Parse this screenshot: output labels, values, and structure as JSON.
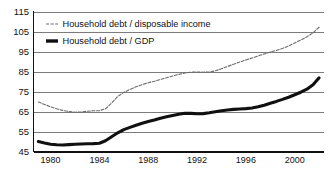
{
  "chart_data": {
    "type": "line",
    "title": "",
    "subtitle": "",
    "xlabel": "",
    "ylabel": "",
    "xlim": [
      1978.6,
      2002.4
    ],
    "ylim": [
      45,
      115
    ],
    "grid": true,
    "legend_position": "top-left",
    "yticks": [
      45,
      55,
      65,
      75,
      85,
      95,
      105,
      115
    ],
    "ytick_labels": [
      "45",
      "55",
      "65",
      "75",
      "85",
      "95",
      "105",
      "115"
    ],
    "xticks": [
      1980,
      1984,
      1988,
      1992,
      1996,
      2000
    ],
    "xtick_labels": [
      "1980",
      "1984",
      "1988",
      "1992",
      "1996",
      "2000"
    ],
    "series": [
      {
        "name": "Household debt / disposable income",
        "style": "dashed-thin",
        "color": "#6b6b6b",
        "x": [
          1979.0,
          1979.5,
          1980.0,
          1980.5,
          1981.0,
          1981.5,
          1982.0,
          1982.5,
          1983.0,
          1983.5,
          1984.0,
          1984.5,
          1985.0,
          1985.5,
          1986.0,
          1986.5,
          1987.0,
          1987.5,
          1988.0,
          1988.5,
          1989.0,
          1989.5,
          1990.0,
          1990.5,
          1991.0,
          1991.5,
          1992.0,
          1992.5,
          1993.0,
          1993.5,
          1994.0,
          1994.5,
          1995.0,
          1995.5,
          1996.0,
          1996.5,
          1997.0,
          1997.5,
          1998.0,
          1998.5,
          1999.0,
          1999.5,
          2000.0,
          2000.5,
          2001.0,
          2001.5,
          2002.0
        ],
        "y": [
          70.0,
          68.8,
          67.6,
          66.6,
          65.8,
          65.2,
          64.9,
          65.0,
          65.4,
          65.6,
          65.7,
          66.6,
          69.5,
          72.8,
          74.8,
          76.3,
          77.6,
          78.7,
          79.6,
          80.4,
          81.3,
          82.1,
          83.0,
          83.8,
          84.5,
          84.9,
          85.0,
          84.9,
          85.0,
          85.6,
          86.6,
          87.8,
          88.9,
          90.0,
          91.0,
          92.0,
          93.0,
          94.0,
          95.0,
          95.8,
          96.8,
          98.0,
          99.5,
          101.0,
          102.6,
          104.6,
          107.4
        ]
      },
      {
        "name": "Household debt / GDP",
        "style": "solid-thick",
        "color": "#101010",
        "x": [
          1979.0,
          1979.5,
          1980.0,
          1980.5,
          1981.0,
          1981.5,
          1982.0,
          1982.5,
          1983.0,
          1983.5,
          1984.0,
          1984.5,
          1985.0,
          1985.5,
          1986.0,
          1986.5,
          1987.0,
          1987.5,
          1988.0,
          1988.5,
          1989.0,
          1989.5,
          1990.0,
          1990.5,
          1991.0,
          1991.5,
          1992.0,
          1992.5,
          1993.0,
          1993.5,
          1994.0,
          1994.5,
          1995.0,
          1995.5,
          1996.0,
          1996.5,
          1997.0,
          1997.5,
          1998.0,
          1998.5,
          1999.0,
          1999.5,
          2000.0,
          2000.5,
          2001.0,
          2001.5,
          2002.0
        ],
        "y": [
          50.2,
          49.5,
          48.9,
          48.6,
          48.5,
          48.7,
          48.9,
          49.0,
          49.1,
          49.2,
          49.4,
          50.6,
          52.6,
          54.6,
          56.2,
          57.3,
          58.4,
          59.4,
          60.2,
          61.0,
          61.9,
          62.6,
          63.3,
          63.9,
          64.4,
          64.3,
          64.1,
          64.2,
          64.6,
          65.1,
          65.6,
          66.0,
          66.3,
          66.5,
          66.7,
          67.0,
          67.6,
          68.4,
          69.4,
          70.3,
          71.3,
          72.4,
          73.6,
          74.9,
          76.4,
          78.6,
          82.1
        ]
      }
    ]
  },
  "legend": {
    "entries": [
      {
        "label": "Household debt / disposable income",
        "marker": "dashed-line-swatch"
      },
      {
        "label": "Household debt / GDP",
        "marker": "thick-line-swatch"
      }
    ]
  }
}
